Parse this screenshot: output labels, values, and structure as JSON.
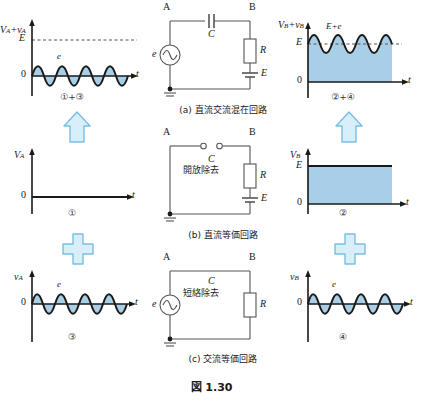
{
  "figure": {
    "caption": "図 1.30",
    "fill_color": "#a9cfe8",
    "wave_color": "#1a1a1a",
    "arrow_color": "#b8dcf0",
    "plus_color": "#b8dcf0"
  },
  "graphs": {
    "top_left": {
      "y_axis_label": "V",
      "y_axis_sub1": "A",
      "y_axis_plus": "+v",
      "y_axis_sub2": "A",
      "y_tick_E": "E",
      "y_tick_zero": "0",
      "x_axis_label": "t",
      "wave_label": "e",
      "bottom_label": "①+③",
      "has_E_dashed": true,
      "wave_baseline": "zero",
      "fill": true
    },
    "top_right": {
      "y_axis_label": "V",
      "y_axis_sub1": "B",
      "y_axis_plus": "+v",
      "y_axis_sub2": "B",
      "y_tick_E": "E",
      "y_tick_zero": "0",
      "x_axis_label": "t",
      "wave_label": "E+e",
      "bottom_label": "②+④",
      "has_E_dashed": true,
      "wave_baseline": "E",
      "fill": true
    },
    "mid_left": {
      "y_axis_label": "V",
      "y_axis_sub1": "A",
      "y_tick_zero": "0",
      "x_axis_label": "t",
      "bottom_label": "①",
      "type": "flat-zero"
    },
    "mid_right": {
      "y_axis_label": "V",
      "y_axis_sub1": "B",
      "y_tick_E": "E",
      "y_tick_zero": "0",
      "x_axis_label": "t",
      "bottom_label": "②",
      "type": "dc-level-E"
    },
    "bot_left": {
      "y_axis_label": "v",
      "y_axis_sub1": "A",
      "y_tick_zero": "0",
      "x_axis_label": "t",
      "wave_label": "e",
      "bottom_label": "③",
      "type": "ac-sine"
    },
    "bot_right": {
      "y_axis_label": "v",
      "y_axis_sub1": "B",
      "y_tick_zero": "0",
      "x_axis_label": "t",
      "wave_label": "e",
      "bottom_label": "④",
      "type": "ac-sine"
    }
  },
  "circuits": {
    "a": {
      "caption": "(a) 直流交流混在回路",
      "node_a": "A",
      "node_b": "B",
      "source_label": "e",
      "cap_label": "C",
      "res_label": "R",
      "bat_label": "E",
      "note": ""
    },
    "b": {
      "caption": "(b) 直流等価回路",
      "node_a": "A",
      "node_b": "B",
      "source_label": "",
      "cap_label": "C",
      "res_label": "R",
      "bat_label": "E",
      "note": "開放除去"
    },
    "c": {
      "caption": "(c) 交流等価回路",
      "node_a": "A",
      "node_b": "B",
      "source_label": "e",
      "cap_label": "C",
      "res_label": "R",
      "bat_label": "",
      "note": "短絡除去"
    }
  },
  "connectors": {
    "arrow_left": "arrow-up",
    "arrow_right": "arrow-up",
    "plus_left": "+",
    "plus_right": "+"
  }
}
